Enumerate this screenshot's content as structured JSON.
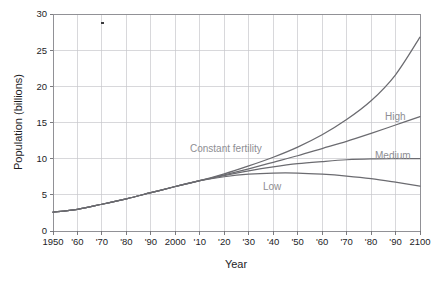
{
  "chart_data": {
    "type": "line",
    "title": "",
    "xlabel": "Year",
    "ylabel": "Population (billions)",
    "xlim": [
      1950,
      2100
    ],
    "ylim": [
      0,
      30
    ],
    "grid": true,
    "legend": "inline-annotations",
    "x_ticks": [
      1950,
      1960,
      1970,
      1980,
      1990,
      2000,
      2010,
      2020,
      2030,
      2040,
      2050,
      2060,
      2070,
      2080,
      2090,
      2100
    ],
    "x_tick_labels": [
      "1950",
      "'60",
      "'70",
      "'80",
      "'90",
      "2000",
      "'10",
      "'20",
      "'30",
      "'40",
      "'50",
      "'60",
      "'70",
      "'80",
      "'90",
      "2100"
    ],
    "y_ticks": [
      0,
      5,
      10,
      15,
      20,
      25,
      30
    ],
    "y_tick_labels": [
      "0",
      "5",
      "10",
      "15",
      "20",
      "25",
      "30"
    ],
    "x": [
      1950,
      1960,
      1970,
      1980,
      1990,
      2000,
      2010,
      2020,
      2030,
      2040,
      2050,
      2060,
      2070,
      2080,
      2090,
      2100
    ],
    "series": [
      {
        "name": "Constant fertility",
        "label": "Constant fertility",
        "color": "#6b6b70",
        "values": [
          2.6,
          3.0,
          3.7,
          4.45,
          5.3,
          6.15,
          6.95,
          7.9,
          9.0,
          10.2,
          11.6,
          13.3,
          15.4,
          18.0,
          21.6,
          26.8
        ]
      },
      {
        "name": "High",
        "label": "High",
        "color": "#6b6b70",
        "values": [
          2.6,
          3.0,
          3.7,
          4.45,
          5.3,
          6.15,
          6.95,
          7.75,
          8.6,
          9.5,
          10.4,
          11.4,
          12.4,
          13.5,
          14.65,
          15.8
        ]
      },
      {
        "name": "Medium",
        "label": "Medium",
        "color": "#6b6b70",
        "values": [
          2.6,
          3.0,
          3.7,
          4.45,
          5.3,
          6.15,
          6.95,
          7.65,
          8.3,
          8.85,
          9.3,
          9.6,
          9.85,
          9.97,
          10.0,
          10.0
        ]
      },
      {
        "name": "Low",
        "label": "Low",
        "color": "#6b6b70",
        "values": [
          2.6,
          3.0,
          3.7,
          4.45,
          5.3,
          6.15,
          6.95,
          7.5,
          7.85,
          8.0,
          8.0,
          7.85,
          7.6,
          7.25,
          6.75,
          6.2
        ]
      }
    ],
    "annotations": [
      {
        "text": "Constant fertility",
        "x_px": 190,
        "y_px": 152,
        "anchor": "start"
      },
      {
        "text": "High",
        "x_px": 385,
        "y_px": 120,
        "anchor": "start"
      },
      {
        "text": "Medium",
        "x_px": 375,
        "y_px": 159,
        "anchor": "start"
      },
      {
        "text": "Low",
        "x_px": 263,
        "y_px": 190,
        "anchor": "start"
      }
    ]
  },
  "axes": {
    "y_label": "Population (billions)",
    "x_label": "Year"
  }
}
